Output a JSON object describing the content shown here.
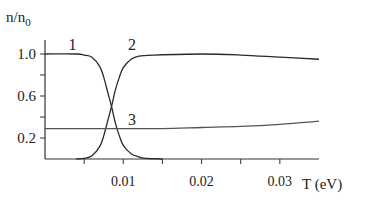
{
  "chart_data": {
    "type": "line",
    "title": "",
    "xlabel": "T (eV)",
    "ylabel": "n/n0",
    "ylabel_main": "n/n",
    "ylabel_sub": "0",
    "xlim": [
      0,
      0.035
    ],
    "ylim": [
      0,
      1.1
    ],
    "grid": false,
    "legend_position": "inline curve labels",
    "x_ticks": [
      0.005,
      0.01,
      0.015,
      0.02,
      0.025,
      0.03
    ],
    "x_tick_labels": [
      "0.01",
      "0.02",
      "0.03"
    ],
    "x_tick_label_values": [
      0.01,
      0.02,
      0.03
    ],
    "y_ticks": [
      0.2,
      0.4,
      0.6,
      0.8,
      1.0
    ],
    "y_tick_labels": [
      "1.0",
      "0.6",
      "0.2"
    ],
    "y_tick_label_values": [
      1.0,
      0.6,
      0.2
    ],
    "series": [
      {
        "name": "1",
        "x": [
          0.0,
          0.004,
          0.005,
          0.006,
          0.007,
          0.0075,
          0.008,
          0.0085,
          0.009,
          0.0095,
          0.01,
          0.011,
          0.012,
          0.013,
          0.015
        ],
        "values": [
          1.0,
          1.0,
          0.99,
          0.97,
          0.88,
          0.78,
          0.64,
          0.5,
          0.34,
          0.22,
          0.13,
          0.05,
          0.02,
          0.005,
          0.0
        ]
      },
      {
        "name": "2",
        "x": [
          0.004,
          0.005,
          0.006,
          0.007,
          0.0075,
          0.008,
          0.0085,
          0.009,
          0.0095,
          0.01,
          0.011,
          0.012,
          0.014,
          0.02,
          0.025,
          0.03,
          0.035
        ],
        "values": [
          0.0,
          0.005,
          0.03,
          0.12,
          0.22,
          0.36,
          0.5,
          0.66,
          0.78,
          0.87,
          0.95,
          0.98,
          0.99,
          1.0,
          0.99,
          0.97,
          0.95
        ]
      },
      {
        "name": "3",
        "x": [
          0.0,
          0.01,
          0.015,
          0.02,
          0.025,
          0.03,
          0.035
        ],
        "values": [
          0.29,
          0.29,
          0.29,
          0.3,
          0.31,
          0.33,
          0.36
        ]
      }
    ],
    "curve_labels": [
      {
        "text": "1",
        "x": 0.0035,
        "y": 1.1
      },
      {
        "text": "2",
        "x": 0.0111,
        "y": 1.1
      },
      {
        "text": "3",
        "x": 0.0111,
        "y": 0.38
      }
    ]
  }
}
